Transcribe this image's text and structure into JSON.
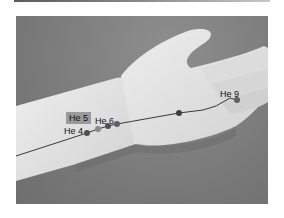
{
  "figure": {
    "points": [
      {
        "id": "he4",
        "label": "He 4",
        "highlighted": false
      },
      {
        "id": "he5",
        "label": "He 5",
        "highlighted": true
      },
      {
        "id": "he6",
        "label": "He 6",
        "highlighted": false
      },
      {
        "id": "he9",
        "label": "He 9",
        "highlighted": false
      }
    ],
    "colors": {
      "background": "#7a7a7a",
      "skin": "#e4e4e4",
      "meridian_line": "#3a3a3a",
      "point_dot": "#505050",
      "label_box": "#9a9a9a"
    }
  }
}
